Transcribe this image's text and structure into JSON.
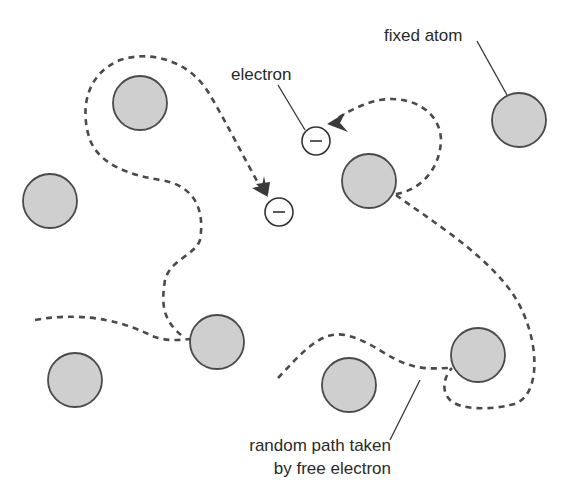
{
  "diagram": {
    "labels": {
      "fixed_atom": "fixed atom",
      "electron": "electron",
      "random_path_line1": "random path taken",
      "random_path_line2": "by free electron"
    },
    "electron_symbol": "−",
    "colors": {
      "atom_fill": "#cfcfcf",
      "atom_stroke": "#4a4a4a",
      "path": "#4a4a4a",
      "text": "#2a2a2a",
      "background": "#ffffff"
    },
    "atoms": [
      {
        "cx": 140,
        "cy": 103
      },
      {
        "cx": 50,
        "cy": 201
      },
      {
        "cx": 369,
        "cy": 181
      },
      {
        "cx": 519,
        "cy": 120
      },
      {
        "cx": 217,
        "cy": 342
      },
      {
        "cx": 75,
        "cy": 380
      },
      {
        "cx": 349,
        "cy": 385
      },
      {
        "cx": 478,
        "cy": 355
      }
    ],
    "electrons": [
      {
        "cx": 316,
        "cy": 141
      },
      {
        "cx": 279,
        "cy": 212
      }
    ]
  }
}
